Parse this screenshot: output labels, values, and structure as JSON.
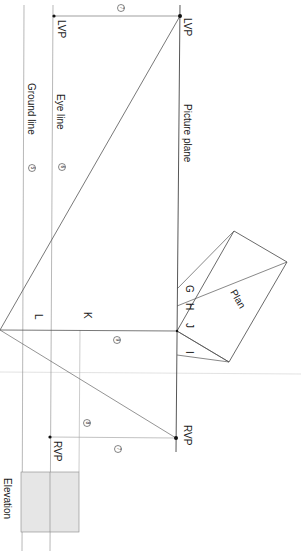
{
  "diagram": {
    "type": "two-point perspective construction",
    "labels": {
      "lvp_right": "LVP",
      "lvp_left": "LVP",
      "rvp_right": "RVP",
      "rvp_left": "RVP",
      "picture_plane": "Picture plane",
      "eye_line": "Eye line",
      "ground_line": "Ground line",
      "plan": "Plan",
      "elevation": "Elevation",
      "point_g": "G",
      "point_h": "H",
      "point_j": "J",
      "point_i": "I",
      "point_k": "K",
      "point_l": "L"
    },
    "step_markers": {
      "m7_top": "7",
      "m7_bottom": "7",
      "m6": "6",
      "m5": "5",
      "m9": "9",
      "m8": "8"
    },
    "colors": {
      "line": "#555555",
      "faint_line": "#bbbbbb",
      "text": "#1a1a1a",
      "elevation_fill": "#e4e4e4"
    }
  }
}
